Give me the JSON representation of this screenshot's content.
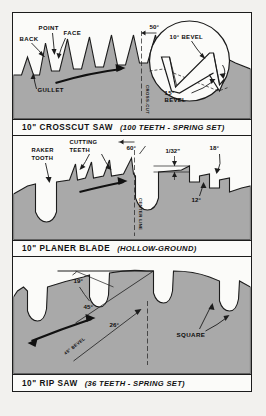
{
  "figure": {
    "background_color": "#f2f1ee",
    "paper_color": "#fbfbf9",
    "ink_color": "#1c1c1c",
    "blade_fill_color": "#a9a9a9"
  },
  "panels": [
    {
      "id": "crosscut",
      "caption_main": "10\" CROSSCUT SAW",
      "caption_sub": "(100 TEETH - SPRING SET)",
      "labels": [
        {
          "name": "back",
          "text": "BACK"
        },
        {
          "name": "point",
          "text": "POINT"
        },
        {
          "name": "face",
          "text": "FACE"
        },
        {
          "name": "gullet",
          "text": "GULLET"
        },
        {
          "name": "angle-50",
          "text": "50°"
        },
        {
          "name": "center-line",
          "text": "CROSS-CUT"
        },
        {
          "name": "bevel-10",
          "text": "10° BEVEL"
        },
        {
          "name": "bevel-15",
          "text": "15° BEVEL"
        }
      ]
    },
    {
      "id": "planer",
      "caption_main": "10\" PLANER BLADE",
      "caption_sub": "(HOLLOW-GROUND)",
      "labels": [
        {
          "name": "raker-tooth",
          "text": "RAKER TOOTH"
        },
        {
          "name": "cutting-teeth",
          "text": "CUTTING TEETH"
        },
        {
          "name": "angle-60",
          "text": "60°"
        },
        {
          "name": "thickness",
          "text": "1/32\""
        },
        {
          "name": "angle-18",
          "text": "18°"
        },
        {
          "name": "angle-12",
          "text": "12°"
        },
        {
          "name": "center-line",
          "text": "CENTER LINE"
        }
      ]
    },
    {
      "id": "ripsaw",
      "caption_main": "10\" RIP SAW",
      "caption_sub": "(36 TEETH - SPRING SET)",
      "labels": [
        {
          "name": "angle-19",
          "text": "19°"
        },
        {
          "name": "angle-45",
          "text": "45°"
        },
        {
          "name": "angle-26",
          "text": "26°"
        },
        {
          "name": "square",
          "text": "SQUARE"
        },
        {
          "name": "bevel-line",
          "text": "45° BEVEL"
        }
      ]
    }
  ]
}
